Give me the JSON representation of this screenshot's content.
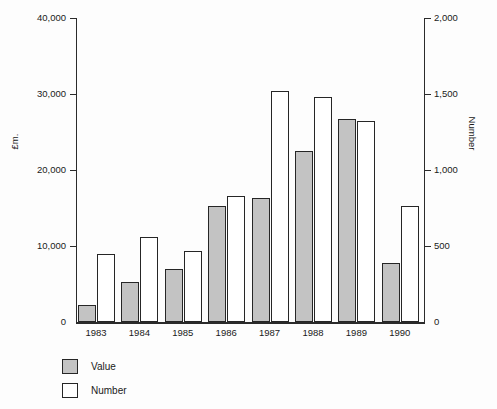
{
  "chart_data": {
    "type": "bar",
    "title": "",
    "subtitle": "",
    "categories": [
      "1983",
      "1984",
      "1985",
      "1986",
      "1987",
      "1988",
      "1989",
      "1990"
    ],
    "series": [
      {
        "name": "Value",
        "axis": "left",
        "unit": "£m.",
        "color": "#c3c3c3",
        "values": [
          2300,
          5300,
          7000,
          15200,
          16300,
          22500,
          26700,
          7700
        ]
      },
      {
        "name": "Number",
        "axis": "right",
        "unit": "Number",
        "color": "#ffffff",
        "values": [
          450,
          560,
          470,
          830,
          1520,
          1480,
          1320,
          760
        ]
      }
    ],
    "xlabel": "",
    "ylabel": "£m.",
    "y2label": "Number",
    "ylim": [
      0,
      40000
    ],
    "y2lim": [
      0,
      2000
    ],
    "yticks": [
      0,
      10000,
      20000,
      30000,
      40000
    ],
    "yticklabels": [
      "0",
      "10,000",
      "20,000",
      "30,000",
      "40,000"
    ],
    "y2ticks": [
      0,
      500,
      1000,
      1500,
      2000
    ],
    "y2ticklabels": [
      "0",
      "500",
      "1,000",
      "1,500",
      "2,000"
    ],
    "grid": false,
    "legend_position": "below-left",
    "legend": [
      "Value",
      "Number"
    ]
  },
  "axes": {
    "left": {
      "title": "£m.",
      "ticks": [
        {
          "label": "40,000",
          "value": 40000
        },
        {
          "label": "30,000",
          "value": 30000
        },
        {
          "label": "20,000",
          "value": 20000
        },
        {
          "label": "10,000",
          "value": 10000
        },
        {
          "label": "0",
          "value": 0
        }
      ]
    },
    "right": {
      "title": "Number",
      "ticks": [
        {
          "label": "2,000",
          "value": 2000
        },
        {
          "label": "1,500",
          "value": 1500
        },
        {
          "label": "1,000",
          "value": 1000
        },
        {
          "label": "500",
          "value": 500
        },
        {
          "label": "0",
          "value": 0
        }
      ]
    },
    "x": {
      "labels": [
        "1983",
        "1984",
        "1985",
        "1986",
        "1987",
        "1988",
        "1989",
        "1990"
      ]
    }
  },
  "legend": {
    "items": [
      {
        "label": "Value",
        "swatch": "filled-gray-square"
      },
      {
        "label": "Number",
        "swatch": "outlined-white-square"
      }
    ]
  }
}
